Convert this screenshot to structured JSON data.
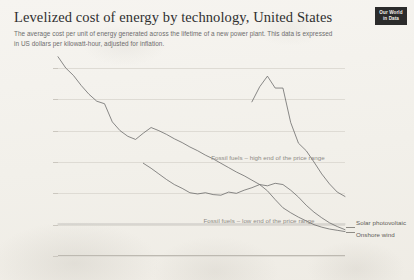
{
  "header": {
    "title": "Levelized cost of energy by technology, United States",
    "subtitle": "The average cost per unit of energy generated across the lifetime of a new power plant. This data is expressed in US dollars per kilowatt-hour, adjusted for inflation."
  },
  "logo": {
    "line1": "Our World",
    "line2": "in Data",
    "name": "our-world-in-data-logo"
  },
  "chart_data": {
    "type": "line",
    "title": "Levelized cost of energy by technology, United States",
    "subtitle": "The average cost per unit of energy generated across the lifetime of a new power plant. This data is expressed in US dollars per kilowatt-hour, adjusted for inflation.",
    "xlabel": "",
    "ylabel": "$/kWh",
    "xlim": [
      1984,
      2021
    ],
    "ylim": [
      0,
      0.3
    ],
    "grid": true,
    "legend": "inline-annotations",
    "y_ticks": [
      0,
      0.05,
      0.1,
      0.15,
      0.2,
      0.25,
      0.3
    ],
    "y_tick_labels": [
      "0 $/kWh",
      "0.05 $/kWh",
      "0.1 $/kWh",
      "0.15 $/kWh",
      "0.2 $/kWh",
      "0.25 $/kWh",
      "0.3 $/kWh"
    ],
    "x_ticks": [
      1984,
      1990,
      1995,
      2000,
      2005,
      2010,
      2015,
      2021
    ],
    "x_tick_labels": [
      "1984",
      "1990",
      "1995",
      "2000",
      "2005",
      "2010",
      "2015",
      "2021"
    ],
    "series": [
      {
        "name": "Solar photovoltaic",
        "end_label": "Solar photovoltaic",
        "x": [
          1984,
          1985,
          1986,
          1987,
          1988,
          1989,
          1990,
          1991,
          1992,
          1993,
          1994,
          1995,
          1996,
          1997,
          1998,
          1999,
          2000,
          2001,
          2002,
          2003,
          2004,
          2005,
          2006,
          2007,
          2008,
          2009,
          2010,
          2011,
          2012,
          2013,
          2014,
          2015,
          2016,
          2017,
          2018,
          2019,
          2020,
          2021
        ],
        "values": [
          0.318,
          0.3,
          0.288,
          0.272,
          0.258,
          0.247,
          0.243,
          0.214,
          0.2,
          0.191,
          0.186,
          0.196,
          0.205,
          0.2,
          0.194,
          0.187,
          0.181,
          0.174,
          0.168,
          0.161,
          0.155,
          0.148,
          0.141,
          0.134,
          0.128,
          0.121,
          0.114,
          0.104,
          0.09,
          0.077,
          0.069,
          0.062,
          0.056,
          0.05,
          0.046,
          0.043,
          0.041,
          0.039
        ]
      },
      {
        "name": "Fossil fuels – high end of the price range",
        "annotation": "Fossil fuels – high end of the price range",
        "x": [
          2009,
          2010,
          2011,
          2012,
          2013,
          2014,
          2015,
          2016,
          2017,
          2018,
          2019,
          2020,
          2021
        ],
        "values": [
          0.246,
          0.27,
          0.287,
          0.268,
          0.268,
          0.213,
          0.18,
          0.168,
          0.15,
          0.131,
          0.115,
          0.102,
          0.095
        ]
      },
      {
        "name": "Onshore wind",
        "end_label": "Onshore wind",
        "x": [
          1995,
          1996,
          1997,
          1998,
          1999,
          2000,
          2001,
          2002,
          2003,
          2004,
          2005,
          2006,
          2007,
          2008,
          2009,
          2010,
          2011,
          2012,
          2013,
          2014,
          2015,
          2016,
          2017,
          2018,
          2019,
          2020,
          2021
        ],
        "values": [
          0.148,
          0.14,
          0.131,
          0.122,
          0.114,
          0.108,
          0.101,
          0.099,
          0.101,
          0.098,
          0.097,
          0.102,
          0.1,
          0.105,
          0.109,
          0.114,
          0.112,
          0.116,
          0.114,
          0.105,
          0.094,
          0.081,
          0.07,
          0.061,
          0.053,
          0.047,
          0.042
        ]
      },
      {
        "name": "Fossil fuels – low end of the price range",
        "annotation": "Fossil fuels – low end of the price range",
        "x": [
          1984,
          2021
        ],
        "values": [
          0.051,
          0.051
        ]
      }
    ],
    "annotations": [
      {
        "text": "Fossil fuels – high end of the price range",
        "x": 2004,
        "y": 0.152
      },
      {
        "text": "Fossil fuels – low end of the price range",
        "x": 2003,
        "y": 0.051
      }
    ]
  }
}
